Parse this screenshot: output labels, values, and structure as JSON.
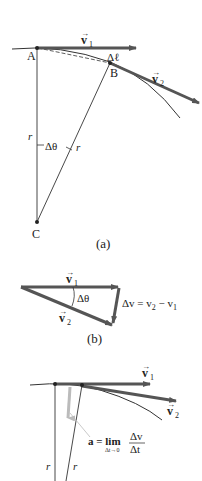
{
  "figure": {
    "panel_a": {
      "caption": "(a)",
      "point_a": "A",
      "point_b": "B",
      "point_c": "C",
      "v1_label": "v",
      "v1_sub": "1",
      "v2_label": "v",
      "v2_sub": "2",
      "arc_label": "Δℓ",
      "radius_label_1": "r",
      "radius_label_2": "r",
      "angle_label": "Δθ"
    },
    "panel_b": {
      "caption": "(b)",
      "v1_label": "v",
      "v1_sub": "1",
      "v2_label": "v",
      "v2_sub": "2",
      "angle_label": "Δθ",
      "dv_eq_prefix": "Δv = v",
      "dv_eq_sub2": "2",
      "dv_eq_minus": " − v",
      "dv_eq_sub1": "1"
    },
    "panel_c": {
      "v1_label": "v",
      "v1_sub": "1",
      "v2_label": "v",
      "v2_sub": "2",
      "accel_lhs": "a = lim",
      "accel_limit": "Δt→0",
      "accel_num": "Δv",
      "accel_den": "Δt",
      "radius_label_1": "r",
      "radius_label_2": "r"
    },
    "colors": {
      "vector": "#555555",
      "line": "#333333",
      "accel": "#bbbbbb"
    }
  }
}
